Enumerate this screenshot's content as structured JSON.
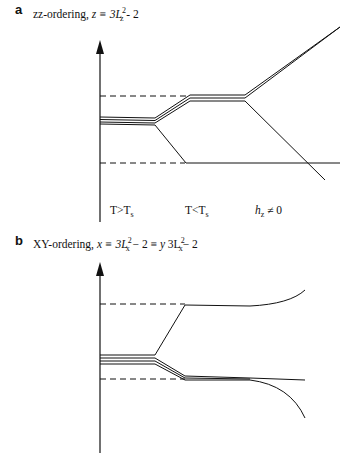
{
  "panel_a": {
    "letter": "a",
    "title_prefix": "zz-ordering, ",
    "title_formula": "z ≡ 3L",
    "title_sup": "2",
    "title_sub": "z",
    "title_suffix": " - 2",
    "x_labels": [
      "T>T",
      "T<T",
      "h"
    ],
    "x_label_subs": [
      "s",
      "s",
      "z"
    ],
    "x_label_suffix_hz": " ≠ 0"
  },
  "panel_b": {
    "letter": "b",
    "title_prefix": "XY-ordering, ",
    "title_formula_1": "x ≡ 3L",
    "title_sup_1": "2",
    "title_sub_1": "x",
    "title_mid": " − 2 ≡ ",
    "title_formula_2": "y",
    "title_mid_2": " 3L",
    "title_sup_2": "2",
    "title_sub_2": "x",
    "title_suffix": "− 2"
  },
  "colors": {
    "line": "#111111",
    "background": "#ffffff"
  }
}
